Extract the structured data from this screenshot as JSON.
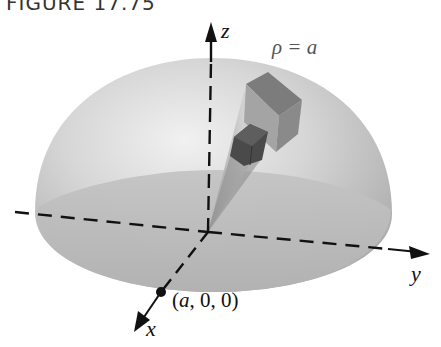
{
  "figure": {
    "header": "FIGURE 17.75"
  },
  "labels": {
    "z_axis": "z",
    "y_axis": "y",
    "x_axis": "x",
    "surface": "ρ = a",
    "point_prefix": "(",
    "point_a": "a",
    "point_rest": ", 0, 0)"
  },
  "colors": {
    "dome_light": "#e4e4e4",
    "dome_dark": "#a9a9a9",
    "base": "#b8b8b8",
    "wedge_top": "#7a7a7a",
    "wedge_cube": "#4e4e4e",
    "axes": "#111111"
  }
}
